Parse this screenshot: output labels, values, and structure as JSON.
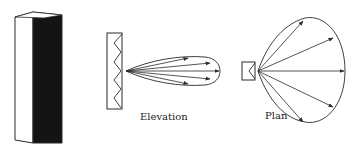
{
  "diagram": {
    "labels": {
      "elevation": "Elevation",
      "plan": "Plan"
    },
    "colors": {
      "line": "#2a2a2a",
      "cabinet_front": "#141414",
      "background": "#ffffff"
    }
  }
}
